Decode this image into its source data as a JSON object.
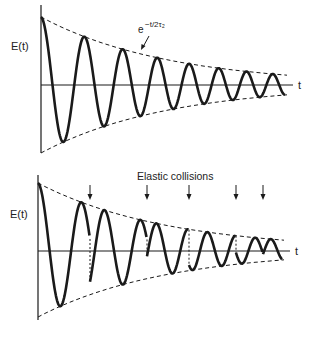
{
  "figure": {
    "width": 313,
    "height": 340,
    "colors": {
      "ink": "#1a1a1a",
      "background": "#ffffff"
    }
  },
  "chart_data": [
    {
      "type": "line",
      "title": "Damped oscillation without collisions",
      "ylabel": "E(t)",
      "xlabel": "t",
      "envelope_label": "e^{-t/2τ₂}",
      "envelope_label_parts": {
        "base": "e",
        "exponent": "−t/2τ₂"
      },
      "series": [
        {
          "name": "E(t)",
          "description": "damped cosine, evenly spaced peaks",
          "peaks_x_px": [
            41,
            88,
            122,
            155,
            183,
            217,
            243,
            265
          ],
          "peaks_y_px": [
            17,
            37,
            48,
            56,
            63,
            70,
            74,
            77
          ]
        },
        {
          "name": "envelope",
          "style": "dashed",
          "description": "upper/lower exponential decay bounds"
        }
      ],
      "layout": {
        "origin_x": 41,
        "axis_y": 85,
        "axis_top": 5,
        "axis_bottom": 152,
        "axis_end_x": 293,
        "curve_end_x": 285,
        "amp0": 68,
        "decay_end_amp": 10
      }
    },
    {
      "type": "line",
      "title": "Damped oscillation with elastic collisions",
      "ylabel": "E(t)",
      "xlabel": "t",
      "annotation": "Elastic collisions",
      "collision_x_px": [
        90,
        147,
        189,
        236,
        263
      ],
      "series": [
        {
          "name": "E(t)",
          "description": "damped cosine with random phase jumps at collisions"
        },
        {
          "name": "envelope",
          "style": "dashed"
        }
      ],
      "layout": {
        "origin_x": 38,
        "axis_y": 250,
        "axis_top": 175,
        "axis_bottom": 318,
        "axis_end_x": 290,
        "curve_end_x": 282,
        "amp0": 67,
        "decay_end_amp": 10
      }
    }
  ],
  "labels": {
    "top_ylabel": "E(t)",
    "top_xlabel": "t",
    "top_env_base": "e",
    "top_env_exp": "−t/2τ₂",
    "bottom_ylabel": "E(t)",
    "bottom_xlabel": "t",
    "bottom_annotation": "Elastic collisions"
  }
}
